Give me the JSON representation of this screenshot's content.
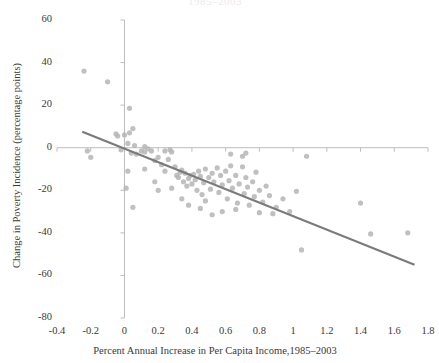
{
  "chart_data": {
    "type": "scatter",
    "title": "1985–2003",
    "xlabel": "Percent Annual Increase in Per Capita Income,1985–2003",
    "ylabel": "Change in Poverty Incidence (percentage points)",
    "xlim": [
      -0.4,
      1.8
    ],
    "ylim": [
      -80,
      60
    ],
    "xticks": [
      "-0.4",
      "-0.2",
      "0",
      "0.2",
      "0.4",
      "0.6",
      "0.8",
      "1",
      "1.2",
      "1.4",
      "1.6",
      "1.8"
    ],
    "xtick_values": [
      -0.4,
      -0.2,
      0,
      0.2,
      0.4,
      0.6,
      0.8,
      1.0,
      1.2,
      1.4,
      1.6,
      1.8
    ],
    "yticks": [
      "60",
      "40",
      "20",
      "0",
      "-20",
      "-40",
      "-60",
      "-80"
    ],
    "ytick_values": [
      60,
      40,
      20,
      0,
      -20,
      -40,
      -60,
      -80
    ],
    "grid": false,
    "legend": null,
    "marker_color": "#b5b5b5",
    "trendline_color": "#7b7b7b",
    "axis_color": "#bdbdbd",
    "points": [
      [
        -0.24,
        36.0
      ],
      [
        -0.1,
        31.0
      ],
      [
        0.03,
        18.5
      ],
      [
        0.03,
        7.0
      ],
      [
        0.05,
        9.0
      ],
      [
        -0.05,
        6.5
      ],
      [
        -0.04,
        5.5
      ],
      [
        0.0,
        6.0
      ],
      [
        0.02,
        2.0
      ],
      [
        0.06,
        1.0
      ],
      [
        -0.22,
        -1.5
      ],
      [
        -0.2,
        -4.5
      ],
      [
        -0.02,
        -1.0
      ],
      [
        0.04,
        -2.5
      ],
      [
        0.07,
        -3.0
      ],
      [
        0.1,
        -1.5
      ],
      [
        0.12,
        -2.0
      ],
      [
        0.12,
        0.5
      ],
      [
        0.14,
        -0.5
      ],
      [
        0.16,
        -1.5
      ],
      [
        0.02,
        -11.0
      ],
      [
        0.01,
        -19.0
      ],
      [
        0.05,
        -28.0
      ],
      [
        0.18,
        -6.0
      ],
      [
        0.2,
        -4.5
      ],
      [
        0.22,
        -8.0
      ],
      [
        0.24,
        -1.5
      ],
      [
        0.26,
        -5.5
      ],
      [
        0.27,
        -1.0
      ],
      [
        0.28,
        -2.0
      ],
      [
        0.3,
        -9.0
      ],
      [
        0.31,
        -13.0
      ],
      [
        0.32,
        -14.0
      ],
      [
        0.33,
        -11.5
      ],
      [
        0.34,
        -10.5
      ],
      [
        0.35,
        -16.0
      ],
      [
        0.36,
        -12.0
      ],
      [
        0.37,
        -18.0
      ],
      [
        0.38,
        -14.5
      ],
      [
        0.39,
        -13.0
      ],
      [
        0.4,
        -17.0
      ],
      [
        0.41,
        -12.5
      ],
      [
        0.42,
        -15.0
      ],
      [
        0.43,
        -20.0
      ],
      [
        0.44,
        -11.0
      ],
      [
        0.45,
        -13.5
      ],
      [
        0.46,
        -22.0
      ],
      [
        0.47,
        -16.5
      ],
      [
        0.48,
        -10.0
      ],
      [
        0.48,
        -25.0
      ],
      [
        0.5,
        -14.0
      ],
      [
        0.51,
        -19.5
      ],
      [
        0.52,
        -12.0
      ],
      [
        0.53,
        -16.0
      ],
      [
        0.55,
        -9.5
      ],
      [
        0.56,
        -21.0
      ],
      [
        0.57,
        -13.0
      ],
      [
        0.58,
        -17.5
      ],
      [
        0.6,
        -11.0
      ],
      [
        0.61,
        -24.0
      ],
      [
        0.62,
        -15.5
      ],
      [
        0.63,
        -8.5
      ],
      [
        0.64,
        -19.0
      ],
      [
        0.66,
        -13.0
      ],
      [
        0.67,
        -26.0
      ],
      [
        0.68,
        -17.0
      ],
      [
        0.7,
        -9.0
      ],
      [
        0.71,
        -21.5
      ],
      [
        0.72,
        -14.0
      ],
      [
        0.73,
        -18.5
      ],
      [
        0.74,
        -27.0
      ],
      [
        0.76,
        -16.0
      ],
      [
        0.77,
        -23.0
      ],
      [
        0.78,
        -11.5
      ],
      [
        0.8,
        -20.0
      ],
      [
        0.82,
        -25.5
      ],
      [
        0.84,
        -18.0
      ],
      [
        0.86,
        -22.5
      ],
      [
        0.24,
        -11.0
      ],
      [
        0.28,
        -19.0
      ],
      [
        0.34,
        -24.0
      ],
      [
        0.45,
        -28.5
      ],
      [
        0.58,
        -30.0
      ],
      [
        0.63,
        -3.0
      ],
      [
        0.7,
        -4.0
      ],
      [
        0.72,
        -2.5
      ],
      [
        0.12,
        -10.0
      ],
      [
        0.18,
        -16.0
      ],
      [
        0.2,
        -20.0
      ],
      [
        0.9,
        -28.0
      ],
      [
        0.94,
        -24.0
      ],
      [
        0.98,
        -30.0
      ],
      [
        1.02,
        -20.5
      ],
      [
        1.05,
        -48.0
      ],
      [
        1.08,
        -4.0
      ],
      [
        1.4,
        -26.0
      ],
      [
        1.46,
        -40.5
      ],
      [
        1.68,
        -40.0
      ],
      [
        0.88,
        -31.0
      ],
      [
        0.52,
        -31.5
      ],
      [
        0.38,
        -27.0
      ],
      [
        0.66,
        -29.0
      ],
      [
        0.8,
        -30.5
      ]
    ],
    "trendline": {
      "x_start": -0.25,
      "y_start": 7.5,
      "x_end": 1.72,
      "y_end": -55.0
    }
  }
}
